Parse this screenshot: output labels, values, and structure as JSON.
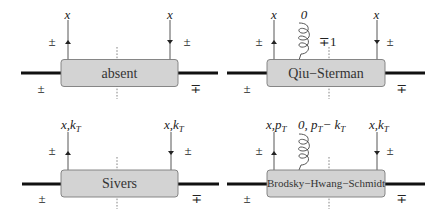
{
  "colors": {
    "box_fill": "#d3d3d3",
    "box_stroke": "#7a7a7a",
    "beam": "#111111",
    "quark_line": "#444444",
    "text": "#222222"
  },
  "panels": [
    {
      "id": "absent",
      "box_label": "absent",
      "left_quark_label": "x",
      "right_quark_label": "x",
      "left_helicity": "±",
      "right_helicity": "±",
      "beam_left_helicity": "±",
      "beam_right_helicity": "∓",
      "gluon": null
    },
    {
      "id": "qiu-sterman",
      "box_label": "Qiu−Sterman",
      "left_quark_label": "x",
      "right_quark_label": "x",
      "left_helicity": "±",
      "right_helicity": "±",
      "beam_left_helicity": "±",
      "beam_right_helicity": "∓",
      "gluon": {
        "label": "0",
        "helicity": "∓1"
      }
    },
    {
      "id": "sivers",
      "box_label": "Sivers",
      "left_quark_label": {
        "main": "x,k",
        "sub": "T"
      },
      "right_quark_label": {
        "main": "x,k",
        "sub": "T"
      },
      "left_helicity": "±",
      "right_helicity": "±",
      "beam_left_helicity": "±",
      "beam_right_helicity": "∓",
      "gluon": null
    },
    {
      "id": "brodsky-hwang-schmidt",
      "box_label": "Brodsky−Hwang−Schmidt",
      "left_quark_label": {
        "main": "x,p",
        "sub": "T"
      },
      "right_quark_label": {
        "main": "x,k",
        "sub": "T"
      },
      "left_helicity": "±",
      "right_helicity": "±",
      "beam_left_helicity": "±",
      "beam_right_helicity": "∓",
      "gluon": {
        "label_parts": [
          "0, p",
          "T",
          "− k",
          "T"
        ],
        "helicity": null
      }
    }
  ]
}
